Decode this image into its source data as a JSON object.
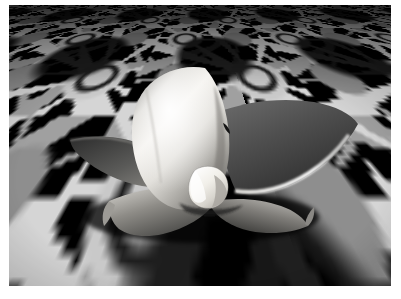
{
  "image": {
    "title": "3D rendered lily flower on tiled floor",
    "domain": "Natural-Image",
    "description": "Grayscale raytraced render of a glossy four-petalled lily-like surface with a faceted central bud, standing on an infinite perspective floor tiled with light-gray star/flower motifs on black.",
    "palette": {
      "page_background": "#ffffff",
      "floor_base": "#000000",
      "tile_light": "#c9c9c9",
      "tile_mid": "#8e8e8e",
      "tile_spike": "#d5d5d5",
      "petal_highlight": "#f2f0ec",
      "petal_midtone": "#9a9893",
      "petal_shadow": "#3a3a3a",
      "petal_dark": "#4e4e4e",
      "bud_white": "#f6f4ef",
      "rim_light": "#e8e6e1"
    },
    "frame": {
      "top_margin_px": 5,
      "bottom_margin_px": 13,
      "left_margin_px": 9,
      "right_margin_px": 10,
      "render_width_px": 382,
      "render_height_px": 281
    },
    "scene": {
      "camera_note": "Low camera, horizon above top edge; floor fills entire frame",
      "light_note": "Key light from upper-left producing broad specular sheen on front petal",
      "floor": {
        "tile_motif": "eight-point star rosette cluster",
        "tile_size_px": 56,
        "perspective_rotate_deg": 81.5
      },
      "objects": [
        {
          "name": "front-petal",
          "tone": "bright",
          "note": "large glossy cupped petal with diagonal highlight"
        },
        {
          "name": "right-petal",
          "tone": "dark",
          "note": "angular sheet with bright rim-lit lower edge"
        },
        {
          "name": "left-petal",
          "tone": "dark",
          "note": "curved blade sweeping left"
        },
        {
          "name": "lower-petal-left",
          "tone": "mid",
          "note": "downswept pointed petal"
        },
        {
          "name": "lower-petal-right",
          "tone": "mid",
          "note": "downswept pointed petal"
        },
        {
          "name": "center-bud",
          "tone": "white",
          "note": "small faceted heart-shaped bud at flower center"
        }
      ]
    }
  }
}
